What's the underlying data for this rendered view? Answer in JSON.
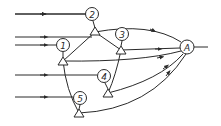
{
  "diagram": {
    "type": "flow-network",
    "stroke_color": "#2a2a2a",
    "background": "#ffffff",
    "nodes": [
      {
        "id": "2",
        "label": "2",
        "cx": 92,
        "cy": 14
      },
      {
        "id": "1",
        "label": "1",
        "cx": 63,
        "cy": 45
      },
      {
        "id": "3",
        "label": "3",
        "cx": 122,
        "cy": 34
      },
      {
        "id": "4",
        "label": "4",
        "cx": 104,
        "cy": 76
      },
      {
        "id": "5",
        "label": "5",
        "cx": 80,
        "cy": 98
      },
      {
        "id": "A",
        "label": "A",
        "cx": 187,
        "cy": 47
      }
    ],
    "junctions": [
      {
        "id": "t2",
        "x": 95,
        "y": 32
      },
      {
        "id": "t1",
        "x": 63,
        "y": 61
      },
      {
        "id": "t3",
        "x": 121,
        "y": 50
      },
      {
        "id": "t4",
        "x": 108,
        "y": 93
      },
      {
        "id": "t5",
        "x": 79,
        "y": 113
      }
    ],
    "inputs": [
      {
        "to": "2",
        "y": 14
      },
      {
        "to": "t2",
        "y": 37
      },
      {
        "to": "1",
        "y": 45
      },
      {
        "to": "4",
        "y": 75
      },
      {
        "to": "5",
        "y": 97
      }
    ],
    "output_label": "A"
  }
}
